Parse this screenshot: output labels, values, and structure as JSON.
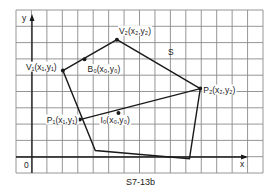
{
  "figure": {
    "caption": "S7-13b",
    "region_label": "S",
    "axes": {
      "x_label": "x",
      "y_label": "y",
      "origin_label": "0"
    },
    "grid": {
      "columns": 16,
      "rows": 10
    },
    "polygon": {
      "name": "S",
      "vertices": [
        {
          "id": "V1",
          "label": "V₁(x₁,y₁)",
          "grid": [
            2.0,
            5.3
          ]
        },
        {
          "id": "V2",
          "label": "V₂(x₂,y₂)",
          "grid": [
            5.5,
            7.2
          ]
        },
        {
          "id": "P2",
          "label": "P₂(x₂,y₂)",
          "grid": [
            10.9,
            4.2
          ]
        },
        {
          "id": "BR",
          "label": "",
          "grid": [
            10.2,
            -0.1
          ]
        },
        {
          "id": "BL",
          "label": "",
          "grid": [
            4.1,
            0.4
          ]
        }
      ]
    },
    "points": [
      {
        "id": "B0",
        "label": "B₀(x₀,y₀)",
        "grid": [
          3.4,
          6.0
        ]
      },
      {
        "id": "P1",
        "label": "P₁(x₁,y₁)",
        "grid": [
          3.1,
          2.3
        ]
      },
      {
        "id": "I0",
        "label": "I₀(x₀,y₀)",
        "grid": [
          5.6,
          2.7
        ]
      }
    ],
    "segment": {
      "from": "P1",
      "to": "P2"
    }
  }
}
